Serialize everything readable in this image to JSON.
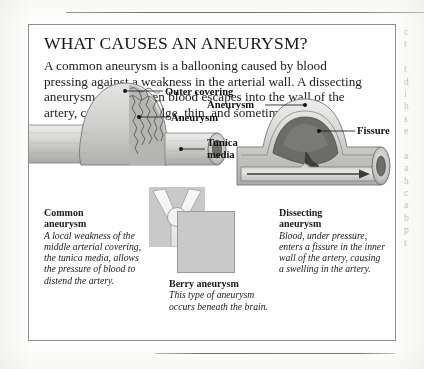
{
  "box": {
    "title": "WHAT CAUSES AN ANEURYSM?",
    "intro": "A common aneurysm is a ballooning caused by blood pressing against a weakness in the arterial wall. A dissecting aneurysm occurs when blood escapes into the wall of the artery, causing it to bulge, thin, and sometimes rupture."
  },
  "diagram_left": {
    "name": "common-aneurysm-illustration",
    "labels": [
      {
        "id": "outer-covering",
        "text": "Outer covering"
      },
      {
        "id": "aneurysm",
        "text": "Aneurysm"
      },
      {
        "id": "tunica-media",
        "text": "Tunica\nmedia"
      },
      {
        "id": "tunica-media-line1",
        "text": "Tunica"
      },
      {
        "id": "tunica-media-line2",
        "text": "media"
      }
    ]
  },
  "diagram_right": {
    "name": "dissecting-aneurysm-illustration",
    "labels": [
      {
        "id": "aneurysm",
        "text": "Aneurysm"
      },
      {
        "id": "fissure",
        "text": "Fissure"
      }
    ]
  },
  "diagram_berry": {
    "name": "berry-aneurysm-illustration"
  },
  "captions": [
    {
      "id": "common-aneurysm",
      "heading_line1": "Common",
      "heading_line2": "aneurysm",
      "body": "A local weakness of the middle arterial covering, the tunica media, allows the pressure of blood to distend the artery."
    },
    {
      "id": "berry-aneurysm",
      "heading_line1": "Berry aneurysm",
      "heading_line2": "",
      "body": "This type of aneurysm occurs beneath the brain."
    },
    {
      "id": "dissecting-aneurysm",
      "heading_line1": "Dissecting",
      "heading_line2": "aneurysm",
      "body": "Blood, under pressure, enters a fissure in the inner wall of the artery, causing a swelling in the artery."
    }
  ],
  "edge_column": {
    "lines": [
      "c",
      "t",
      "",
      "t",
      "d",
      "i",
      "h",
      "s",
      "e",
      "",
      "a",
      "a",
      "h",
      "c",
      "a",
      "b",
      "p",
      "t"
    ]
  },
  "colors": {
    "page": "#fdfdfc",
    "ink": "#1a1a1a",
    "rule": "#7d7d7d",
    "box_border": "#8d8d8d",
    "tissue_light": "#d8d8d6",
    "tissue_mid": "#b6b6b4",
    "tissue_dark": "#8e8e8c",
    "blood_dark": "#6f6f6d",
    "berry_bg": "#c9c9c9"
  }
}
